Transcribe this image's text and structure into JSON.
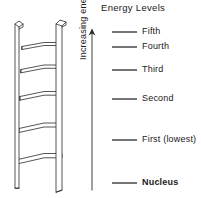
{
  "diagram": {
    "title": "Energy Levels",
    "axis": {
      "label": "Increasing energy",
      "direction": "up",
      "arrow_tip_y": 30,
      "arrow_base_y": 190
    },
    "ladder": {
      "name": "ladder-illustration",
      "rail_count": 2,
      "rung_count": 5,
      "rung_y_positions": [
        45,
        68,
        95,
        127,
        158
      ],
      "style": "3d-line-drawing",
      "stroke_color": "#2b2b2b",
      "fill_color": "#ffffff"
    },
    "levels": [
      {
        "label": "Fifth",
        "y": 32,
        "line_x1": 112,
        "line_x2": 137,
        "bold": false
      },
      {
        "label": "Fourth",
        "y": 47,
        "line_x1": 112,
        "line_x2": 137,
        "bold": false
      },
      {
        "label": "Third",
        "y": 70,
        "line_x1": 112,
        "line_x2": 137,
        "bold": false
      },
      {
        "label": "Second",
        "y": 99,
        "line_x1": 112,
        "line_x2": 137,
        "bold": false
      },
      {
        "label": "First (lowest)",
        "y": 140,
        "line_x1": 112,
        "line_x2": 137,
        "bold": false
      },
      {
        "label": "Nucleus",
        "y": 183,
        "line_x1": 112,
        "line_x2": 137,
        "bold": true
      }
    ],
    "colors": {
      "ink": "#1a1a1a",
      "line": "#2b2b2b",
      "background": "#ffffff"
    }
  }
}
